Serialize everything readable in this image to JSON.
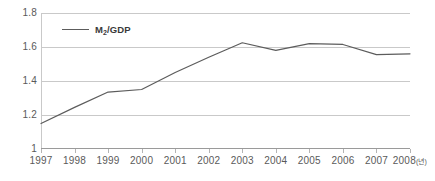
{
  "chart_data": {
    "type": "line",
    "title": "",
    "subtitle": "",
    "xlabel": "",
    "ylabel": "",
    "unit_note": "(년)",
    "grid": true,
    "legend_position": "top-left-inside",
    "x": [
      "1997",
      "1998",
      "1999",
      "2000",
      "2001",
      "2002",
      "2003",
      "2004",
      "2005",
      "2006",
      "2007",
      "2008"
    ],
    "xlim": [
      "1997",
      "2008"
    ],
    "ylim": [
      1.0,
      1.8
    ],
    "ytick_labels": [
      "1.8",
      "1.6",
      "1.4",
      "1.2",
      "1"
    ],
    "ytick_values": [
      1.8,
      1.6,
      1.4,
      1.2,
      1.0
    ],
    "series": [
      {
        "name": "M₂/GDP",
        "color": "#5c5c5c",
        "values": [
          1.15,
          1.245,
          1.335,
          1.35,
          1.45,
          1.54,
          1.625,
          1.58,
          1.62,
          1.615,
          1.555,
          1.56
        ]
      }
    ]
  },
  "legend": {
    "entries": [
      {
        "label_main": "M",
        "label_sub": "2",
        "label_rest": "/GDP"
      }
    ]
  },
  "axis": {
    "x_labels": [
      {
        "text": "1997",
        "unit": ""
      },
      {
        "text": "1998",
        "unit": ""
      },
      {
        "text": "1999",
        "unit": ""
      },
      {
        "text": "2000",
        "unit": ""
      },
      {
        "text": "2001",
        "unit": ""
      },
      {
        "text": "2002",
        "unit": ""
      },
      {
        "text": "2003",
        "unit": ""
      },
      {
        "text": "2004",
        "unit": ""
      },
      {
        "text": "2005",
        "unit": ""
      },
      {
        "text": "2006",
        "unit": ""
      },
      {
        "text": "2007",
        "unit": ""
      },
      {
        "text": "2008",
        "unit": "(년)"
      }
    ],
    "y_labels": [
      "1.8",
      "1.6",
      "1.4",
      "1.2",
      "1"
    ]
  }
}
